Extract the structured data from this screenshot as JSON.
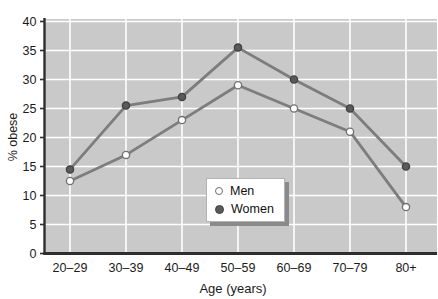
{
  "colors": {
    "page_bg": "#ffffff",
    "plot_bg": "#c9c9c9",
    "grid": "#ffffff",
    "axis": "#2e2e2e",
    "text": "#1b1b1b",
    "line": "#7d7d7d",
    "men_marker_fill": "#ffffff",
    "men_marker_stroke": "#707070",
    "women_marker_fill": "#5a5a5a",
    "women_marker_stroke": "#3f3f3f",
    "legend_bg": "#ffffff",
    "legend_border": "#b3b3b3",
    "legend_shadow": "#8a8a8a"
  },
  "chart_data": {
    "type": "line",
    "title": "",
    "xlabel": "Age (years)",
    "ylabel": "% obese",
    "categories": [
      "20–29",
      "30–39",
      "40–49",
      "50–59",
      "60–69",
      "70–79",
      "80+"
    ],
    "series": [
      {
        "name": "Men",
        "marker": "open-circle",
        "values": [
          12.5,
          17,
          23,
          29,
          25,
          21,
          8
        ]
      },
      {
        "name": "Women",
        "marker": "filled-circle",
        "values": [
          14.5,
          25.5,
          27,
          35.5,
          30,
          25,
          15
        ]
      }
    ],
    "ylim": [
      0,
      40
    ],
    "yticks": [
      0,
      5,
      10,
      15,
      20,
      25,
      30,
      35,
      40
    ],
    "grid": true,
    "legend_position": "inside-lower-center",
    "legend": {
      "men_label": "Men",
      "women_label": "Women"
    }
  }
}
